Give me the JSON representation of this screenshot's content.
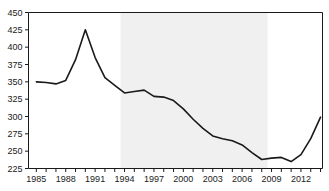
{
  "chart_data": {
    "type": "line",
    "title": "",
    "subtitle": "",
    "xlabel": "",
    "ylabel": "",
    "xlim": [
      1984.2,
      2014.2
    ],
    "ylim": [
      225,
      450
    ],
    "grid": false,
    "legend": null,
    "y_ticks": [
      225,
      250,
      275,
      300,
      325,
      350,
      375,
      400,
      425,
      450
    ],
    "x_ticks_labeled": [
      1985,
      1988,
      1991,
      1994,
      1997,
      2000,
      2003,
      2006,
      2009,
      2012
    ],
    "x_ticks_minor_step": 1,
    "line_color": "#1a1a1a",
    "line_width": 1.6,
    "shaded_band": {
      "x_start": 1993.6,
      "x_end": 2008.6,
      "color": "#f0f0f0",
      "label": ""
    },
    "x": [
      1985,
      1986,
      1987,
      1988,
      1989,
      1990,
      1991,
      1992,
      1993,
      1994,
      1995,
      1996,
      1997,
      1998,
      1999,
      2000,
      2001,
      2002,
      2003,
      2004,
      2005,
      2006,
      2007,
      2008,
      2009,
      2010,
      2011,
      2012,
      2013,
      2014
    ],
    "values": [
      350,
      349,
      347,
      352,
      382,
      425,
      385,
      356,
      345,
      334,
      336,
      338,
      329,
      328,
      323,
      311,
      296,
      283,
      272,
      268,
      265,
      259,
      248,
      238,
      240,
      241,
      235,
      245,
      268,
      299
    ],
    "series": [
      {
        "name": "series-1",
        "values": [
          350,
          349,
          347,
          352,
          382,
          425,
          385,
          356,
          345,
          334,
          336,
          338,
          329,
          328,
          323,
          311,
          296,
          283,
          272,
          268,
          265,
          259,
          248,
          238,
          240,
          241,
          235,
          245,
          268,
          299
        ]
      }
    ]
  },
  "axes": {
    "y_tick_labels": [
      "450",
      "425",
      "400",
      "375",
      "350",
      "325",
      "300",
      "275",
      "250",
      "225"
    ],
    "x_tick_labels": [
      "1985",
      "1988",
      "1991",
      "1994",
      "1997",
      "2000",
      "2003",
      "2006",
      "2009",
      "2012"
    ]
  }
}
